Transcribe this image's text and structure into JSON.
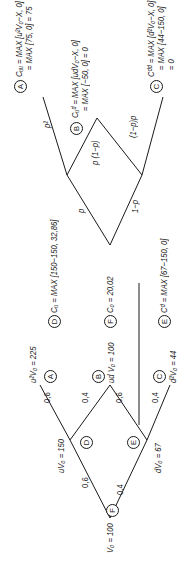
{
  "left_tree": {
    "root": {
      "label": "V₀ = 100"
    },
    "up_node": {
      "label": "uV₀ = 150"
    },
    "down_node": {
      "label": "dV₀ = 67"
    },
    "leaves": [
      {
        "marker": "A",
        "label": "u²V₀ = 225"
      },
      {
        "marker": "B",
        "label": "ud V₀ = 100"
      },
      {
        "marker": "C",
        "label": "d²V₀ = 44"
      }
    ],
    "node_markers": {
      "root": "F",
      "up": "D",
      "down": "E"
    },
    "edge_probs": {
      "root_up": "0,6",
      "root_down": "0,4",
      "up_up": "0,6",
      "up_down": "0,4",
      "down_up": "0,6",
      "down_down": "0,4"
    }
  },
  "right_tree": {
    "root": {
      "marker": "F",
      "label": "C₀ = 20,02"
    },
    "up_node": {
      "marker": "D",
      "label": "Cᵤ = MAX [150−150, 32,86]"
    },
    "down_node": {
      "marker": "E",
      "label": "Cᵈ = MAX [67−150, 0]"
    },
    "leaves": [
      {
        "marker": "A",
        "line1": "Cᵤᵤ = MAX [u²V₀−X, 0]",
        "line2": "= MAX [75, 0] = 75"
      },
      {
        "marker": "B",
        "line1": "Cᵤᵈ = MAX [udV₀−X, 0]",
        "line2": "= MAX [−50, 0] = 0"
      },
      {
        "marker": "C",
        "line1": "Cᵈᵈ = MAX [d²V₀−X, 0]",
        "line2": "= MAX [44−150, 0]",
        "line3": "= 0"
      }
    ],
    "edge_probs": {
      "root_up": "p",
      "root_down": "1−p",
      "up_up": "p²",
      "up_down": "p (1−p)",
      "down_up": "(1−p)p",
      "down_down": "(1−p)²"
    }
  }
}
